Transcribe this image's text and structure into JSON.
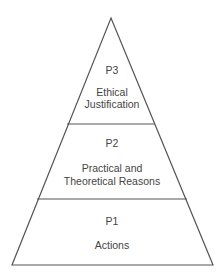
{
  "diagram": {
    "type": "pyramid",
    "line_color": "#555555",
    "text_color": "#444444",
    "levels": [
      {
        "id": "P3",
        "position": "top",
        "code": "P3",
        "lines": [
          "Ethical",
          "Justification"
        ]
      },
      {
        "id": "P2",
        "position": "middle",
        "code": "P2",
        "lines": [
          "Practical and",
          "Theoretical Reasons"
        ]
      },
      {
        "id": "P1",
        "position": "bottom",
        "code": "P1",
        "lines": [
          "Actions"
        ]
      }
    ]
  }
}
